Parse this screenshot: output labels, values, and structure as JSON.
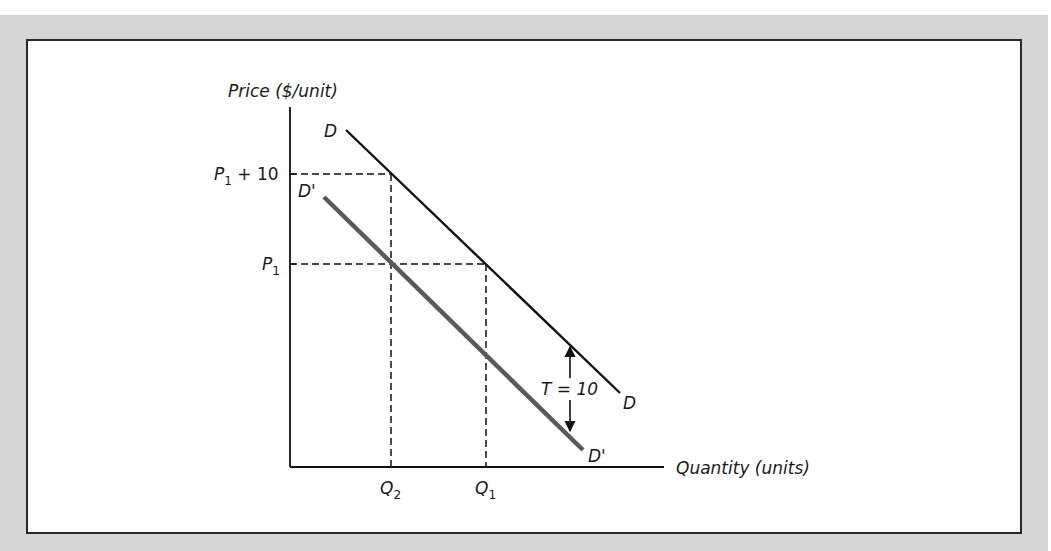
{
  "figure": {
    "y_axis_label": "Price ($/unit)",
    "x_axis_label": "Quantity (units)",
    "y_ticks": {
      "p1_plus_10": {
        "base": "P",
        "sub": "1",
        "suffix": " + 10"
      },
      "p1": {
        "base": "P",
        "sub": "1"
      }
    },
    "x_ticks": {
      "q2": {
        "base": "Q",
        "sub": "2"
      },
      "q1": {
        "base": "Q",
        "sub": "1"
      }
    },
    "curves": {
      "demand": {
        "label": "D",
        "color": "#111111"
      },
      "demand_shifted": {
        "label": "D'",
        "color": "#5a5a5a"
      }
    },
    "tax_annotation": "T = 10"
  },
  "colors": {
    "background_band": "#d6d6d6",
    "frame_border": "#2a2a2a",
    "ink": "#111111",
    "shifted_curve": "#5a5a5a"
  }
}
